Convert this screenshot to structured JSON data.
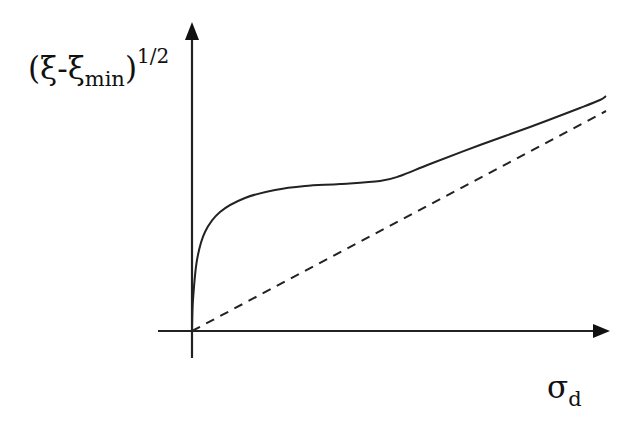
{
  "chart_data": {
    "type": "line",
    "title": "",
    "xlabel": "σ_d",
    "ylabel": "(ξ-ξ_min)^(1/2)",
    "grid": false,
    "legend": null,
    "ticks": {
      "x": [],
      "y": []
    },
    "series": [
      {
        "name": "measured curve",
        "style": "solid",
        "description": "Steep initial rise from origin, plateau, then linear increase approaching the asymptote",
        "points_px": [
          [
            192,
            331
          ],
          [
            193,
            300
          ],
          [
            197,
            260
          ],
          [
            205,
            232
          ],
          [
            220,
            212
          ],
          [
            245,
            198
          ],
          [
            275,
            190
          ],
          [
            305,
            186
          ],
          [
            340,
            184
          ],
          [
            380,
            181
          ],
          [
            400,
            176
          ],
          [
            430,
            164
          ],
          [
            480,
            145
          ],
          [
            530,
            127
          ],
          [
            580,
            108
          ],
          [
            600,
            100
          ],
          [
            606,
            96
          ]
        ]
      },
      {
        "name": "asymptote",
        "style": "dashed",
        "description": "Straight dashed line from origin",
        "points_px": [
          [
            192,
            331
          ],
          [
            606,
            111
          ]
        ]
      }
    ],
    "axes": {
      "origin_px": [
        192,
        331
      ],
      "x_axis": {
        "from_px": 158,
        "to_px": 610,
        "arrow": true
      },
      "y_axis": {
        "from_px": 358,
        "to_px": 22,
        "arrow": true
      }
    }
  },
  "labels": {
    "y": {
      "main": "(ξ-ξ",
      "sub": "min",
      "close": ")",
      "sup": "1/2"
    },
    "x": {
      "main": "σ",
      "sub": "d"
    }
  },
  "colors": {
    "line": "#222222",
    "axis": "#222222",
    "background": "#ffffff"
  }
}
